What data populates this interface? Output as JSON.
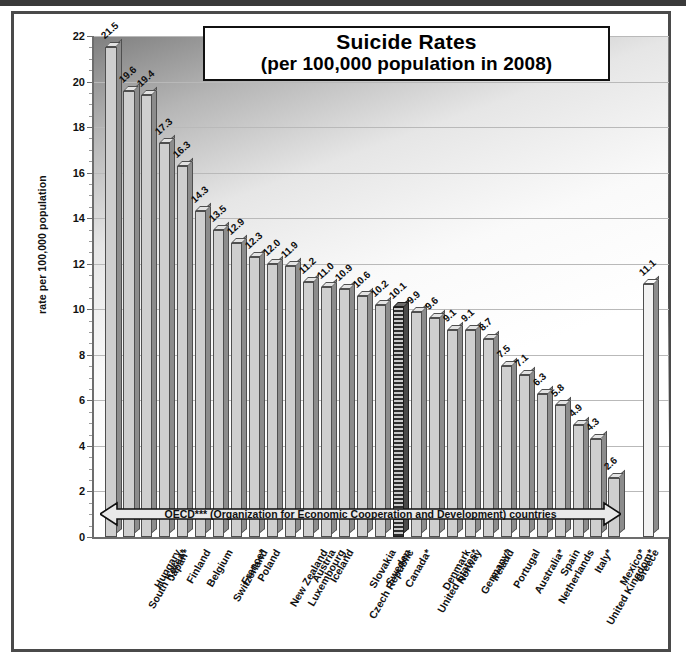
{
  "figure": {
    "title_line1": "Suicide Rates",
    "title_line2": "(per 100,000 population in 2008)",
    "annotation": "OECD*** (Organization for Economic Cooperation and Development) countries"
  },
  "chart_data": {
    "type": "bar",
    "title": "Suicide Rates (per 100,000 population in 2008)",
    "xlabel": "",
    "ylabel": "rate per 100,000 population",
    "ylim": [
      0,
      22
    ],
    "ytick_step": 2,
    "yticks": [
      "0",
      "2",
      "4",
      "6",
      "8",
      "10",
      "12",
      "14",
      "16",
      "18",
      "20",
      "22"
    ],
    "grid": true,
    "legend": "none",
    "categories": [
      "South Korea*",
      "Hungary",
      "Japan*",
      "Finland",
      "Belgium",
      "Switzerland",
      "France*",
      "Poland",
      "New Zealand",
      "Luxembourg",
      "Austria",
      "Iceland",
      "Czech Republic",
      "Slovakia",
      "Sweden",
      "Canada*",
      "United States*",
      "Denmark",
      "Norway",
      "Germany*",
      "Ireland",
      "Portugal",
      "Australia*",
      "Netherlands",
      "Spain",
      "United Kingdom*",
      "Italy*",
      "Mexico*",
      "Greece",
      "OECD*** average"
    ],
    "values": [
      21.5,
      19.6,
      19.4,
      17.3,
      16.3,
      14.3,
      13.5,
      12.9,
      12.3,
      12.0,
      11.9,
      11.2,
      11.0,
      10.9,
      10.6,
      10.2,
      10.1,
      9.9,
      9.6,
      9.1,
      9.1,
      8.7,
      7.5,
      7.1,
      6.3,
      5.8,
      4.9,
      4.3,
      2.6,
      11.1
    ],
    "value_labels": [
      "21.5",
      "19.6",
      "19.4",
      "17.3",
      "16.3",
      "14.3",
      "13.5",
      "12.9",
      "12.3",
      "12.0",
      "11.9",
      "11.2",
      "11.0",
      "10.9",
      "10.6",
      "10.2",
      "10.1",
      "9.9",
      "9.6",
      "9.1",
      "9.1",
      "8.7",
      "7.5",
      "7.1",
      "6.3",
      "5.8",
      "4.9",
      "4.3",
      "2.6",
      "11.1"
    ],
    "highlighted_category": "United States*",
    "average_category": "OECD*** average",
    "annotation": "OECD*** (Organization for Economic Cooperation and Development) countries"
  },
  "colors": {
    "bar_face": "#cfcfcf",
    "bar_side": "#8c8c8c",
    "bar_top": "#e3e3e3",
    "highlight_bar": "#2e2e2e",
    "average_bar": "#f2f2f2",
    "axis": "#6d6d6d",
    "gridline": "#b9b9b9",
    "frame": "#4a4a4a",
    "text": "#111111"
  }
}
